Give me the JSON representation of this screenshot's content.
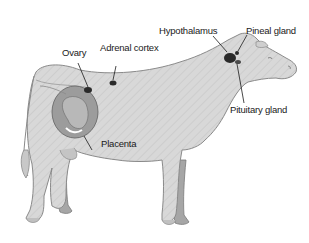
{
  "labels": {
    "ovary": "Ovary",
    "adrenal_cortex": "Adrenal cortex",
    "hypothalamus": "Hypothalamus",
    "pineal_gland": "Pineal gland",
    "pituitary_gland": "Pituitary gland",
    "placenta": "Placenta"
  },
  "colors": {
    "body_fill": "#d6d6d6",
    "body_stroke": "#8a8a8a",
    "far_leg_fill": "#a8a8a8",
    "uterus_fill": "#9a9a9a",
    "gland_fill": "#2a2a2a",
    "text": "#1a1a1a"
  }
}
